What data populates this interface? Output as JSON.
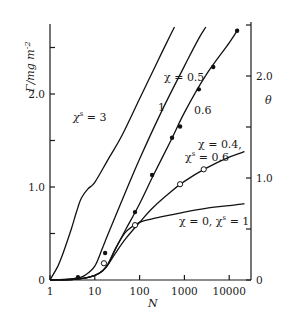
{
  "chart_data": {
    "type": "line",
    "title": "",
    "xlabel": "N",
    "ylabel": "Γ/mg m⁻²",
    "y2label": "θ",
    "xscale": "log",
    "xlim": [
      1,
      25000
    ],
    "ylim": [
      0,
      2.75
    ],
    "y2lim": [
      0,
      2.55
    ],
    "xticks": [
      1,
      10,
      100,
      1000,
      10000
    ],
    "xtick_labels": [
      "1",
      "10",
      "100",
      "1000",
      "10000"
    ],
    "yticks": [
      0,
      0.5,
      1.0,
      1.5,
      2.0,
      2.5
    ],
    "ytick_labels": [
      "0",
      "",
      "1.0",
      "",
      "2.0",
      ""
    ],
    "y2ticks": [
      0,
      0.5,
      1.0,
      1.5,
      2.0,
      2.5
    ],
    "y2tick_labels": [
      "0",
      "",
      "1.0",
      "",
      "2.0",
      ""
    ],
    "grid": false,
    "legend": "none (curves labelled inline)",
    "series": [
      {
        "name": "χˢ = 3",
        "label": "χˢ = 3",
        "x": [
          1,
          1.5,
          2,
          3,
          4,
          5,
          7,
          10,
          20,
          40,
          100,
          200,
          400,
          600
        ],
        "y": [
          0,
          0.15,
          0.3,
          0.55,
          0.75,
          0.88,
          0.98,
          1.05,
          1.3,
          1.55,
          1.95,
          2.25,
          2.55,
          2.72
        ]
      },
      {
        "name": "χ = 0.5, χˢ = 1",
        "label": "1",
        "x": [
          1,
          2,
          4,
          6,
          10,
          15,
          20,
          40,
          100,
          300,
          1000,
          2000,
          3000
        ],
        "y": [
          0,
          0.005,
          0.02,
          0.05,
          0.15,
          0.35,
          0.5,
          0.85,
          1.3,
          1.8,
          2.3,
          2.58,
          2.72
        ]
      },
      {
        "name": "χ = 0.5, χˢ = 0.6",
        "label": "0.6",
        "x": [
          1,
          3,
          6,
          10,
          15,
          20,
          30,
          50,
          100,
          200,
          500,
          1000,
          3000,
          10000,
          16000
        ],
        "y": [
          0,
          0.005,
          0.02,
          0.05,
          0.1,
          0.17,
          0.35,
          0.55,
          0.82,
          1.12,
          1.5,
          1.8,
          2.2,
          2.55,
          2.7
        ]
      },
      {
        "name": "χ = 0.4, χˢ = 0.6",
        "label": "χ = 0.4, χˢ = 0.6",
        "x": [
          1,
          3,
          6,
          10,
          15,
          20,
          30,
          50,
          100,
          200,
          500,
          1000,
          3000,
          10000,
          22000
        ],
        "y": [
          0,
          0.005,
          0.02,
          0.05,
          0.1,
          0.17,
          0.3,
          0.45,
          0.62,
          0.78,
          0.95,
          1.06,
          1.2,
          1.32,
          1.38
        ]
      },
      {
        "name": "χ = 0, χˢ = 1",
        "label": "χ = 0, χˢ = 1",
        "x": [
          1,
          3,
          6,
          10,
          15,
          20,
          30,
          50,
          100,
          200,
          500,
          1000,
          3000,
          10000,
          22000
        ],
        "y": [
          0,
          0.005,
          0.02,
          0.05,
          0.1,
          0.18,
          0.35,
          0.52,
          0.62,
          0.66,
          0.7,
          0.73,
          0.77,
          0.8,
          0.82
        ]
      }
    ],
    "markers": {
      "filled": {
        "name": "experimental (filled circles)",
        "x": [
          4.2,
          17,
          79,
          190,
          530,
          800,
          2100,
          4400,
          15000
        ],
        "y": [
          0.03,
          0.29,
          0.73,
          1.13,
          1.53,
          1.65,
          2.05,
          2.29,
          2.68
        ]
      },
      "open": {
        "name": "experimental (open circles)",
        "x": [
          16,
          79,
          800,
          2700
        ],
        "y": [
          0.18,
          0.59,
          1.03,
          1.19
        ]
      }
    },
    "annotations": [
      {
        "text": "χˢ = 3",
        "x_px": 70,
        "y_px": 118
      },
      {
        "text": "χ = 0.5",
        "x_px": 163,
        "y_px": 80
      },
      {
        "text": "1",
        "x_px": 158,
        "y_px": 110
      },
      {
        "text": "0.6",
        "x_px": 193,
        "y_px": 112
      },
      {
        "text": "χ = 0.4,",
        "x_px": 198,
        "y_px": 147
      },
      {
        "text": "χˢ = 0.6",
        "x_px": 186,
        "y_px": 160
      },
      {
        "text": "χ = 0, χˢ = 1",
        "x_px": 179,
        "y_px": 226
      }
    ]
  },
  "labels": {
    "ylabel": "Γ/mg m",
    "ylabel_sup": "-2",
    "y2label": "θ",
    "xlabel": "N",
    "ann_chi3": "χ",
    "ann_chi3_sup": "s",
    "ann_chi3_rest": " = 3",
    "ann_chi05": "χ = 0.5",
    "ann_one": "1",
    "ann_06": "0.6",
    "ann_chi04": "χ = 0.4,",
    "ann_chis06_chi": "χ",
    "ann_chis06_sup": "s",
    "ann_chis06_rest": " = 0.6",
    "ann_chi0": "χ = 0,  χ",
    "ann_chi0_sup": "s",
    "ann_chi0_rest": " = 1"
  }
}
